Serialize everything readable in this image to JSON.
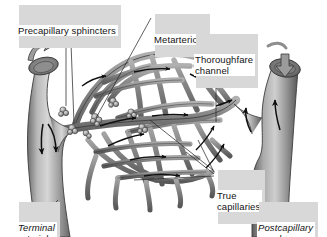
{
  "figure": {
    "background_color": "#ffffff",
    "width": 327,
    "height": 237
  },
  "palette": {
    "vessel_light": "#c9c9c9",
    "vessel_mid": "#9a9a9a",
    "vessel_dark": "#5f5f5f",
    "vessel_outline": "#3a3a3a",
    "arrow_color": "#101010",
    "leader_color": "#2b2b2b",
    "label_text": "#141414",
    "label_shadow": "#d8d8d8"
  },
  "labels": [
    {
      "id": "precapillary-sphincters",
      "text": "Precapillary sphincters",
      "style": "regular",
      "lines": 1
    },
    {
      "id": "metarteriole",
      "text": "Metarteriole",
      "style": "regular",
      "lines": 1
    },
    {
      "id": "thoroughfare-channel",
      "text": "Thoroughfare\nchannel",
      "style": "regular",
      "lines": 2
    },
    {
      "id": "true-capillaries",
      "text": "True\ncapillaries",
      "style": "regular",
      "lines": 2
    },
    {
      "id": "terminal-arteriole",
      "text": "Terminal\narteriole",
      "style": "italic",
      "lines": 2
    },
    {
      "id": "postcapillary-venule",
      "text": "Postcapillary\nvenule",
      "style": "italic",
      "lines": 2
    }
  ],
  "structures": {
    "terminal_arteriole": "large vessel at left with cut-open lumen at top and outward flow arrow",
    "postcapillary_venule": "large vessel at right with cut-open lumen at top and inward filled arrow",
    "capillary_network": "dense anastomosing mesh of true capillaries between arteriole and venule",
    "metarteriole": "central straight vessel continuing from arteriole into the bed",
    "thoroughfare_channel": "distal continuation of metarteriole draining into venule",
    "precapillary_sphincters": "beaded muscular rings at capillary origins"
  }
}
